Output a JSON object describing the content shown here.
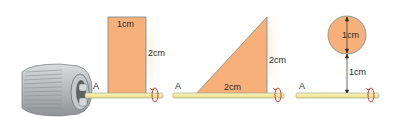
{
  "figure": {
    "colors": {
      "shape_fill": "#f8b07a",
      "shape_stroke": "#6e8b8a",
      "rod_fill": "#f7eda0",
      "rod_stroke": "#8ea080",
      "rotation_arrow": "#e0402e",
      "drill_body": "#b9bdbf",
      "text": "#2b2b2b"
    },
    "panels": [
      {
        "id": "rectangle",
        "axis_label": "A",
        "shape": "rectangle",
        "width_label": "1cm",
        "height_label": "2cm"
      },
      {
        "id": "triangle",
        "axis_label": "A",
        "shape": "right-triangle",
        "base_label": "2cm",
        "height_label": "2cm"
      },
      {
        "id": "circle",
        "axis_label": "A",
        "shape": "circle",
        "diameter_label": "1cm",
        "distance_label": "1cm"
      }
    ]
  }
}
